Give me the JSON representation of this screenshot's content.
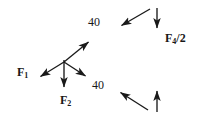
{
  "figure": {
    "background": "#ffffff",
    "stroke_color": "#1a1a1a",
    "width": 202,
    "height": 129
  },
  "labels": {
    "angle_top": "40",
    "angle_mid": "40",
    "force_1": "F",
    "force_1_sub": "1",
    "force_2": "F",
    "force_2_sub": "2",
    "force_x_half": "F",
    "force_x_half_sub": "4",
    "force_x_half_div": "/2"
  },
  "arrows": [
    {
      "name": "arrow-up-right",
      "from": [
        64,
        62
      ],
      "to": [
        91,
        40
      ],
      "direction": "up-right",
      "group": "central-junction"
    },
    {
      "name": "arrow-down-left-f1",
      "from": [
        64,
        62
      ],
      "to": [
        38,
        78
      ],
      "direction": "down-left",
      "label": "F1",
      "group": "central-junction"
    },
    {
      "name": "arrow-down-f2",
      "from": [
        64,
        60
      ],
      "to": [
        64,
        90
      ],
      "direction": "down",
      "label": "F2",
      "group": "central-junction"
    },
    {
      "name": "arrow-down-right",
      "from": [
        64,
        62
      ],
      "to": [
        88,
        78
      ],
      "direction": "down-right",
      "group": "central-junction"
    },
    {
      "name": "arrow-down-left-top",
      "from": [
        150,
        9
      ],
      "to": [
        119,
        27
      ],
      "direction": "down-left",
      "group": "top-right-pair"
    },
    {
      "name": "arrow-down-vertical-top",
      "from": [
        157,
        8
      ],
      "to": [
        157,
        31
      ],
      "direction": "down",
      "label": "F4/2",
      "group": "top-right-pair"
    },
    {
      "name": "arrow-up-left-bottom",
      "from": [
        148,
        110
      ],
      "to": [
        118,
        91
      ],
      "direction": "up-left",
      "group": "bottom-right-pair"
    },
    {
      "name": "arrow-up-vertical-bottom",
      "from": [
        157,
        112
      ],
      "to": [
        157,
        88
      ],
      "direction": "up",
      "group": "bottom-right-pair"
    }
  ]
}
